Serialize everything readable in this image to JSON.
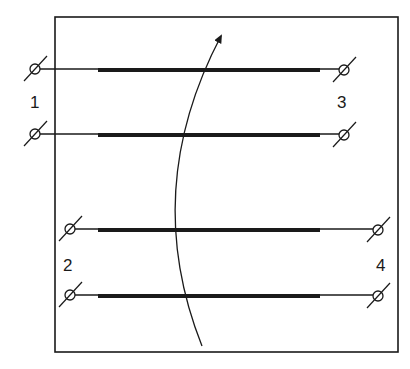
{
  "diagram": {
    "colors": {
      "stroke": "#1a1a1a",
      "background": "#ffffff"
    },
    "frame": {
      "x": 55,
      "y": 17,
      "width": 343,
      "height": 335
    },
    "windings": [
      {
        "id": "w1a",
        "y": 69,
        "left_terminal_x": 35,
        "right_terminal_x": 345,
        "bar_x1": 98,
        "bar_x2": 320
      },
      {
        "id": "w1b",
        "y": 134,
        "left_terminal_x": 35,
        "right_terminal_x": 345,
        "bar_x1": 98,
        "bar_x2": 320
      },
      {
        "id": "w2a",
        "y": 229,
        "left_terminal_x": 70,
        "right_terminal_x": 378,
        "bar_x1": 98,
        "bar_x2": 320
      },
      {
        "id": "w2b",
        "y": 295,
        "left_terminal_x": 70,
        "right_terminal_x": 378,
        "bar_x1": 98,
        "bar_x2": 320
      }
    ],
    "labels": [
      {
        "text": "1",
        "x": 30,
        "y": 108
      },
      {
        "text": "3",
        "x": 337,
        "y": 108
      },
      {
        "text": "2",
        "x": 63,
        "y": 271
      },
      {
        "text": "4",
        "x": 376,
        "y": 271
      }
    ],
    "arrow": {
      "path": "M 202 346 Q 140 190 221 36",
      "label": ""
    }
  }
}
